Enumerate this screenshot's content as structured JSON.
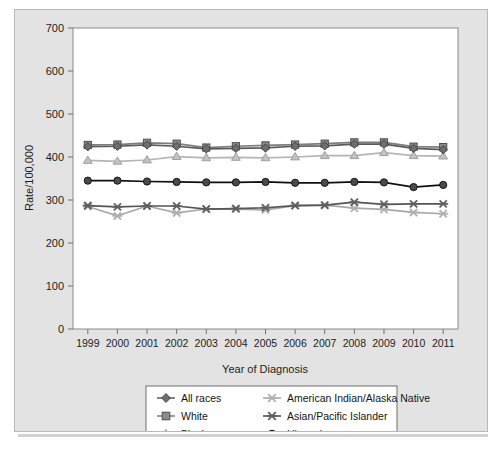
{
  "figure": {
    "background_color": "#e3e3e3",
    "plot_background_color": "#ffffff",
    "border_color": "#b9b9b9"
  },
  "chart_data": {
    "type": "line",
    "title": "",
    "xlabel": "Year of Diagnosis",
    "ylabel": "Rate/100,000",
    "categories": [
      "1999",
      "2000",
      "2001",
      "2002",
      "2003",
      "2004",
      "2005",
      "2006",
      "2007",
      "2008",
      "2009",
      "2010",
      "2011"
    ],
    "x": [
      1999,
      2000,
      2001,
      2002,
      2003,
      2004,
      2005,
      2006,
      2007,
      2008,
      2009,
      2010,
      2011
    ],
    "ylim": [
      0,
      700
    ],
    "yticks": [
      0,
      100,
      200,
      300,
      400,
      500,
      600,
      700
    ],
    "ytick_labels": [
      "0",
      "100",
      "200",
      "300",
      "400",
      "500",
      "600",
      "700"
    ],
    "grid": false,
    "legend_position": "below-axes",
    "series": [
      {
        "name": "All races",
        "marker": "diamond",
        "color": "#6e6e6e",
        "line_color": "#5a5a5a",
        "values": [
          424,
          425,
          428,
          425,
          419,
          420,
          421,
          425,
          426,
          430,
          430,
          420,
          417
        ]
      },
      {
        "name": "White",
        "marker": "square",
        "color": "#8c8c8c",
        "line_color": "#7d7d7d",
        "values": [
          428,
          429,
          433,
          431,
          422,
          425,
          427,
          429,
          431,
          434,
          434,
          424,
          423
        ]
      },
      {
        "name": "Black",
        "marker": "triangle",
        "color": "#c2c2c2",
        "line_color": "#b5b5b5",
        "values": [
          392,
          390,
          393,
          401,
          398,
          399,
          398,
          400,
          403,
          403,
          410,
          403,
          402
        ]
      },
      {
        "name": "American Indian/Alaska Native",
        "marker": "x",
        "color": "#b0b0b0",
        "line_color": "#a8a8a8",
        "values": [
          285,
          263,
          286,
          270,
          279,
          279,
          277,
          287,
          288,
          281,
          278,
          271,
          268
        ]
      },
      {
        "name": "Asian/Pacific Islander",
        "marker": "x",
        "color": "#5f5f5f",
        "line_color": "#555555",
        "values": [
          287,
          284,
          286,
          286,
          279,
          280,
          282,
          287,
          288,
          295,
          290,
          291,
          291
        ]
      },
      {
        "name": "Hispanic",
        "marker": "circle",
        "color": "#4a4a4a",
        "line_color": "#101010",
        "values": [
          345,
          345,
          343,
          342,
          341,
          341,
          342,
          340,
          340,
          342,
          341,
          330,
          335
        ]
      }
    ]
  },
  "legend": {
    "entries": [
      {
        "label": "All races",
        "marker": "diamond",
        "color": "#6e6e6e"
      },
      {
        "label": "American Indian/Alaska Native",
        "marker": "x",
        "color": "#b0b0b0"
      },
      {
        "label": "White",
        "marker": "square",
        "color": "#8c8c8c"
      },
      {
        "label": "Asian/Pacific Islander",
        "marker": "x",
        "color": "#5f5f5f"
      },
      {
        "label": "Black",
        "marker": "triangle",
        "color": "#c2c2c2"
      },
      {
        "label": "Hispanic",
        "marker": "circle",
        "color": "#4a4a4a"
      }
    ]
  }
}
